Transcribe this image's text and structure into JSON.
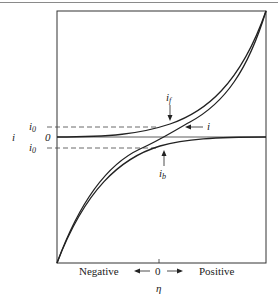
{
  "diagram": {
    "type": "current-overpotential curve",
    "y_axis": {
      "label": "i",
      "ticks": [
        "i0",
        "0",
        "i0"
      ]
    },
    "x_axis": {
      "label": "η",
      "left_label": "Negative",
      "center_label": "0",
      "right_label": "Positive",
      "left_arrow": "←",
      "right_arrow": "→"
    },
    "annotations": {
      "forward_current": {
        "symbol": "i",
        "subscript": "f"
      },
      "net_current": {
        "symbol": "i"
      },
      "backward_current": {
        "symbol": "i",
        "subscript": "b"
      }
    },
    "labels": {
      "i0_upper_sym": "i",
      "i0_upper_sub": "0",
      "zero": "0",
      "i0_lower_sym": "i",
      "i0_lower_sub": "0",
      "y_axis_symbol": "i"
    },
    "colors": {
      "curve": "#222222",
      "frame": "#333333",
      "dash": "#444444"
    }
  }
}
